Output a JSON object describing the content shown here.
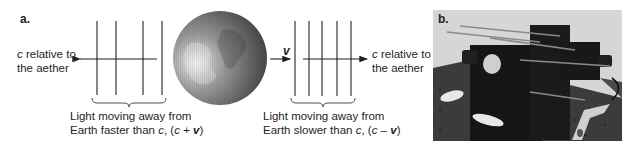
{
  "panel_a": {
    "label": "a.",
    "left": {
      "side_label_c": "c",
      "side_label_rest_1": " relative to",
      "side_label_line2": "the aether",
      "wavefront_count": 4,
      "arrow_direction": "left",
      "caption_line1": "Light moving away from",
      "caption_line2_pre": "Earth faster than ",
      "caption_line2_c": "c",
      "caption_line2_mid": ", (",
      "caption_line2_c2": "c",
      "caption_line2_op": " + ",
      "caption_line2_v": "v",
      "caption_line2_end": ")"
    },
    "earth": {
      "name": "Earth globe",
      "velocity_label": "v",
      "velocity_direction": "right"
    },
    "right": {
      "side_label_c": "c",
      "side_label_rest_1": " relative to",
      "side_label_line2": "the aether",
      "wavefront_count": 5,
      "arrow_direction": "right",
      "caption_line1": "Light moving away from",
      "caption_line2_pre": "Earth slower than ",
      "caption_line2_c": "c",
      "caption_line2_mid": ", (",
      "caption_line2_c2": "c",
      "caption_line2_op": " – ",
      "caption_line2_v": "v",
      "caption_line2_end": ")"
    }
  },
  "panel_b": {
    "label": "b.",
    "photo_subject": "interferometer apparatus on optical table"
  },
  "colors": {
    "ink": "#231f20",
    "globe_light": "#d9d9d9",
    "globe_dark": "#3d3d3d",
    "photo_bg": "#d6d6d4",
    "photo_table": "#3b3b3b",
    "apparatus": "#151515"
  }
}
